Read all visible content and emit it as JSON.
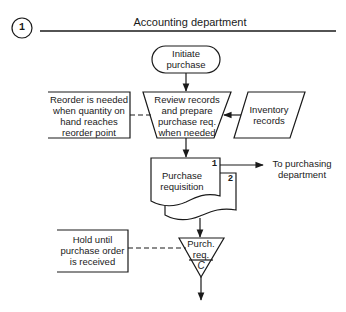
{
  "diagram": {
    "section_number": "1",
    "title": "Accounting department",
    "colors": {
      "stroke": "#1a1a1a",
      "background": "#ffffff"
    },
    "nodes": {
      "start": {
        "shape": "terminal",
        "lines": [
          "Initiate",
          "purchase"
        ]
      },
      "review": {
        "shape": "manual-operation",
        "lines": [
          "Review records",
          "and prepare",
          "purchase req.",
          "when needed"
        ]
      },
      "inventory": {
        "shape": "parallelogram",
        "lines": [
          "Inventory",
          "records"
        ]
      },
      "reorder_note": {
        "shape": "annotation",
        "lines": [
          "Reorder is needed",
          "when quantity on",
          "hand reaches",
          "reorder point"
        ]
      },
      "requisition": {
        "shape": "multi-document",
        "lines": [
          "Purchase",
          "requisition"
        ],
        "copy_numbers": [
          "1",
          "2"
        ]
      },
      "to_purchasing": {
        "shape": "off-flow-label",
        "lines": [
          "To purchasing",
          "department"
        ]
      },
      "file": {
        "shape": "offline-file",
        "lines": [
          "Purch.",
          "req."
        ],
        "order": "C"
      },
      "hold_note": {
        "shape": "annotation",
        "lines": [
          "Hold until",
          "purchase order",
          "is received"
        ]
      }
    },
    "edges": [
      {
        "from": "start",
        "to": "review",
        "style": "solid-arrow"
      },
      {
        "from": "inventory",
        "to": "review",
        "style": "solid-arrow"
      },
      {
        "from": "reorder_note",
        "to": "review",
        "style": "dashed"
      },
      {
        "from": "review",
        "to": "requisition",
        "style": "solid-arrow"
      },
      {
        "from": "requisition",
        "to": "to_purchasing",
        "style": "solid-arrow",
        "copy": "1"
      },
      {
        "from": "requisition",
        "to": "file",
        "style": "solid-arrow",
        "copy": "2"
      },
      {
        "from": "hold_note",
        "to": "file",
        "style": "dashed"
      },
      {
        "from": "file",
        "to": "continuation",
        "style": "solid-arrow"
      }
    ]
  }
}
